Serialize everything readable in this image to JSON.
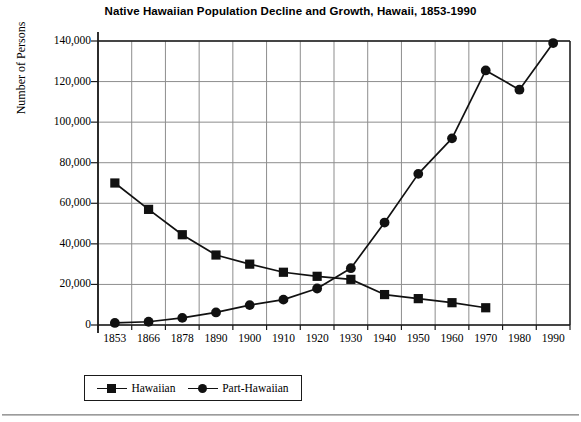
{
  "chart_data": {
    "type": "line",
    "title": "Native Hawaiian Population Decline and Growth, Hawaii, 1853-1990",
    "xlabel": "",
    "ylabel": "Number of Persons",
    "categories": [
      "1853",
      "1866",
      "1878",
      "1890",
      "1900",
      "1910",
      "1920",
      "1930",
      "1940",
      "1950",
      "1960",
      "1970",
      "1980",
      "1990"
    ],
    "ylim": [
      0,
      140000
    ],
    "yticks": [
      "0",
      "20,000",
      "40,000",
      "60,000",
      "80,000",
      "100,000",
      "120,000",
      "140,000"
    ],
    "ytick_values": [
      0,
      20000,
      40000,
      60000,
      80000,
      100000,
      120000,
      140000
    ],
    "grid": true,
    "legend_position": "bottom-left",
    "series": [
      {
        "name": "Hawaiian",
        "marker": "square",
        "color": "#111111",
        "values": [
          70000,
          57000,
          44500,
          34500,
          30000,
          26000,
          24000,
          22500,
          15000,
          13000,
          11000,
          8500,
          null,
          null
        ]
      },
      {
        "name": "Part-Hawaiian",
        "marker": "circle",
        "color": "#111111",
        "values": [
          1000,
          1600,
          3500,
          6200,
          9800,
          12500,
          18000,
          28000,
          50500,
          74500,
          92000,
          125500,
          116000,
          139000
        ]
      }
    ]
  },
  "legend": {
    "entries": [
      {
        "label": "Hawaiian"
      },
      {
        "label": "Part-Hawaiian"
      }
    ]
  }
}
